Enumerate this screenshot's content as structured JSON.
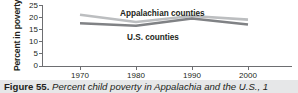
{
  "figure": {
    "caption_label": "Figure 55.",
    "caption_body": "Percent child poverty in Appalachia and the U.S., 1",
    "caption_full": "Figure 55. Percent child poverty in Appalachia and the U.S., 1"
  },
  "chart_data": {
    "type": "line",
    "title": "",
    "xlabel": "",
    "ylabel": "Percent in poverty",
    "x": [
      1970,
      1980,
      1990,
      2000
    ],
    "xticklabels": [
      "1970",
      "1980",
      "1990",
      "2000"
    ],
    "xlim": [
      1965,
      2005
    ],
    "ylim": [
      0,
      26
    ],
    "yticks": [
      0,
      5,
      10,
      15,
      20,
      25
    ],
    "yticklabels": [
      "0",
      "5",
      "10",
      "15",
      "20",
      "25"
    ],
    "grid": false,
    "legend": "inline-labels",
    "series": [
      {
        "name": "Appalachian counties",
        "values": [
          21.0,
          18.0,
          20.5,
          19.0
        ],
        "color": "#bcbec0"
      },
      {
        "name": "U.S. counties",
        "values": [
          17.5,
          16.5,
          19.5,
          17.0
        ],
        "color": "#808285"
      }
    ]
  },
  "labels": {
    "series_appalachian": "Appalachian counties",
    "series_us": "U.S. counties",
    "y_axis_title": "Percent in poverty",
    "ytick_25": "25",
    "ytick_20": "20",
    "ytick_15": "15",
    "ytick_10": "10",
    "ytick_5": "5",
    "ytick_0": "0",
    "xtick_1970": "1970",
    "xtick_1980": "1980",
    "xtick_1990": "1990",
    "xtick_2000": "2000"
  },
  "colors": {
    "appalachian_line": "#bcbec0",
    "us_line": "#808285",
    "axis": "#6d6e71",
    "text": "#231f20",
    "caption_background": "#e6e7e8",
    "page_background": "#ffffff"
  }
}
